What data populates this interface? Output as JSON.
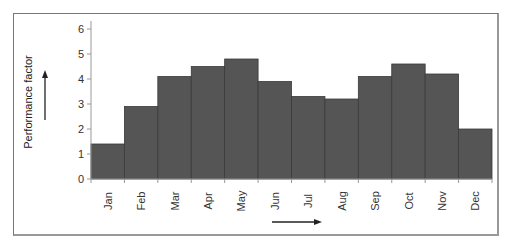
{
  "chart_data": {
    "type": "bar",
    "title": "",
    "xlabel": "",
    "ylabel": "Performance factor",
    "ylim": [
      0,
      6
    ],
    "yticks": [
      0,
      1,
      2,
      3,
      4,
      5,
      6
    ],
    "grid": false,
    "legend": null,
    "categories": [
      "Jan",
      "Feb",
      "Mar",
      "Apr",
      "May",
      "Jun",
      "Jul",
      "Aug",
      "Sep",
      "Oct",
      "Nov",
      "Dec"
    ],
    "values": [
      1.4,
      2.9,
      4.1,
      4.5,
      4.8,
      3.9,
      3.3,
      3.2,
      4.1,
      4.6,
      4.2,
      2.0
    ],
    "annotations": [
      "up-arrow beside y-axis label",
      "right-arrow below x-axis labels"
    ],
    "bar_color": "#555555"
  }
}
